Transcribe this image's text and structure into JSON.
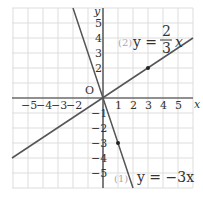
{
  "chart_data": {
    "type": "line",
    "title": "",
    "xlabel": "x",
    "ylabel": "y",
    "origin_label": "O",
    "xlim": [
      -6,
      6
    ],
    "ylim": [
      -6,
      6
    ],
    "grid": true,
    "x_ticks": [
      "-5",
      "-4",
      "-3",
      "-2",
      "1",
      "2",
      "3",
      "4",
      "5"
    ],
    "y_ticks": [
      "5",
      "4",
      "3",
      "2",
      "-1",
      "-2",
      "-3",
      "-4",
      "-5"
    ],
    "series": [
      {
        "name": "(1) y = -3x",
        "label_num": "(1)",
        "equation": "y = −3x",
        "slope": -3,
        "marked_point": [
          1,
          -3
        ]
      },
      {
        "name": "(2) y = 2/3 x",
        "label_num": "(2)",
        "equation_lhs": "y =",
        "frac_num": "2",
        "frac_den": "3",
        "equation_rhs": "x",
        "slope": 0.6667,
        "marked_point": [
          3,
          2
        ]
      }
    ]
  }
}
